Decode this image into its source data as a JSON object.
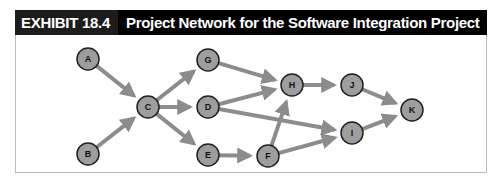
{
  "header": {
    "exhibit_label": "EXHIBIT 18.4",
    "title": "Project Network for the Software Integration Project"
  },
  "colors": {
    "header_bg": "#000000",
    "exhibit_bg": "#1c1c1c",
    "node_fill": "#9e9e9e",
    "node_stroke": "#222222",
    "arrow": "#8c8c8c",
    "frame_border": "#bdbdbd"
  },
  "network": {
    "nodes": [
      {
        "id": "A",
        "x": 88,
        "y": 59
      },
      {
        "id": "B",
        "x": 88,
        "y": 154
      },
      {
        "id": "C",
        "x": 148,
        "y": 107
      },
      {
        "id": "G",
        "x": 208,
        "y": 60
      },
      {
        "id": "D",
        "x": 208,
        "y": 107
      },
      {
        "id": "E",
        "x": 208,
        "y": 155
      },
      {
        "id": "H",
        "x": 292,
        "y": 85
      },
      {
        "id": "J",
        "x": 352,
        "y": 85
      },
      {
        "id": "F",
        "x": 268,
        "y": 156
      },
      {
        "id": "I",
        "x": 352,
        "y": 133
      },
      {
        "id": "K",
        "x": 412,
        "y": 110
      }
    ],
    "edges": [
      {
        "from": "A",
        "to": "C"
      },
      {
        "from": "B",
        "to": "C"
      },
      {
        "from": "C",
        "to": "G"
      },
      {
        "from": "C",
        "to": "D"
      },
      {
        "from": "C",
        "to": "E"
      },
      {
        "from": "G",
        "to": "H"
      },
      {
        "from": "D",
        "to": "H"
      },
      {
        "from": "D",
        "to": "I"
      },
      {
        "from": "E",
        "to": "F"
      },
      {
        "from": "F",
        "to": "H"
      },
      {
        "from": "F",
        "to": "I"
      },
      {
        "from": "H",
        "to": "J"
      },
      {
        "from": "J",
        "to": "K"
      },
      {
        "from": "I",
        "to": "K"
      }
    ]
  }
}
